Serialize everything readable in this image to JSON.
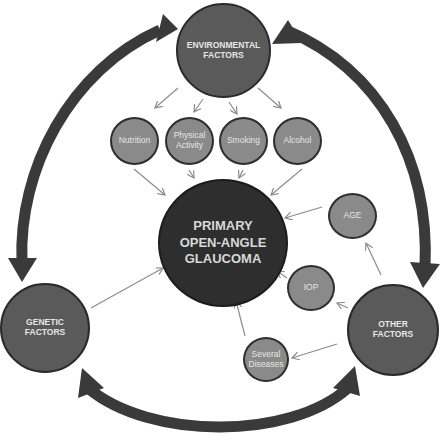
{
  "diagram": {
    "center": {
      "line1": "PRIMARY",
      "line2": "OPEN-ANGLE",
      "line3": "GLAUCOMA"
    },
    "environmental": {
      "line1": "ENVIRONMENTAL",
      "line2": "FACTORS"
    },
    "genetic": {
      "line1": "GENETIC",
      "line2": "FACTORS"
    },
    "other": {
      "line1": "OTHER",
      "line2": "FACTORS"
    },
    "environmental_children": [
      {
        "line1": "Nutrition",
        "line2": ""
      },
      {
        "line1": "Physical",
        "line2": "Activity"
      },
      {
        "line1": "Smoking",
        "line2": ""
      },
      {
        "line1": "Alcohol",
        "line2": ""
      }
    ],
    "other_children": [
      {
        "line1": "AGE",
        "line2": ""
      },
      {
        "line1": "IOP",
        "line2": ""
      },
      {
        "line1": "Several",
        "line2": "Diseases"
      }
    ],
    "colors": {
      "center_fill": "#2e2e2e",
      "major_fill": "#5a5a5a",
      "minor_fill": "#8a8a8a",
      "outer_arrow": "#3a3a3a",
      "thin_arrow": "#8c8c8c",
      "text": "#e6e6e6"
    }
  }
}
